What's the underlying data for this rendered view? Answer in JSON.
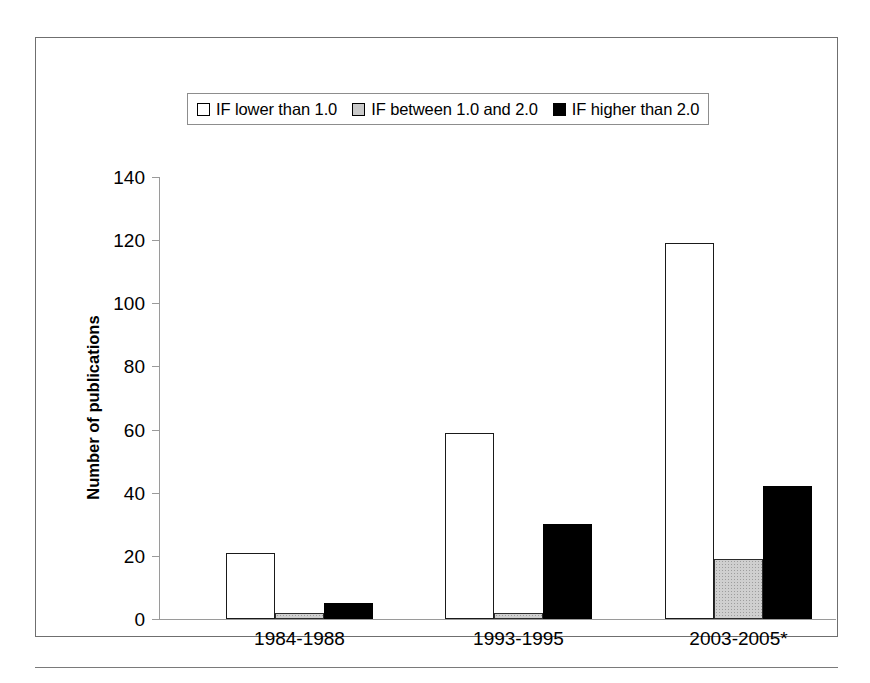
{
  "chart_data": {
    "type": "bar",
    "title": "",
    "xlabel": "",
    "ylabel": "Number of publications",
    "categories": [
      "1984-1988",
      "1993-1995",
      "2003-2005*"
    ],
    "series": [
      {
        "name": "IF lower than 1.0",
        "color": "#ffffff",
        "values": [
          21,
          59,
          119
        ]
      },
      {
        "name": "IF between 1.0 and 2.0",
        "color": "#cfcfcf",
        "values": [
          2,
          2,
          19
        ]
      },
      {
        "name": "IF higher than 2.0",
        "color": "#000000",
        "values": [
          5,
          30,
          42
        ]
      }
    ],
    "ylim": [
      0,
      140
    ],
    "yticks": [
      0,
      20,
      40,
      60,
      80,
      100,
      120,
      140
    ],
    "ytick_labels": [
      "0",
      "20",
      "40",
      "60",
      "80",
      "100",
      "120",
      "140"
    ],
    "grid": false,
    "legend_position": "top-center"
  },
  "legend": {
    "items": [
      {
        "label": "IF lower than 1.0",
        "swatch": "white-square-icon"
      },
      {
        "label": "IF between 1.0 and 2.0",
        "swatch": "gray-square-icon"
      },
      {
        "label": "IF higher than 2.0",
        "swatch": "black-square-icon"
      }
    ]
  }
}
